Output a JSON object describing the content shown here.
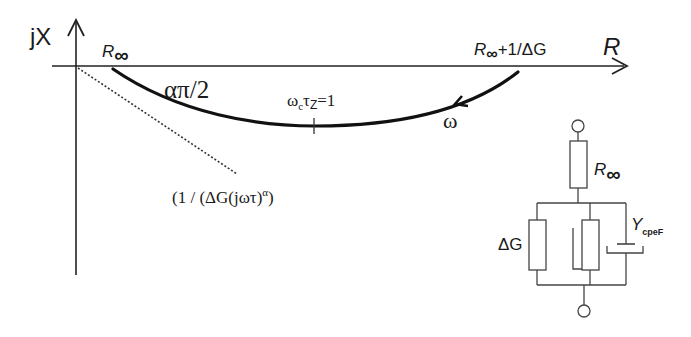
{
  "diagram": {
    "type": "Cole-Cole impedance plot with equivalent circuit",
    "axes": {
      "y_label": "jX",
      "x_label": "R"
    },
    "arc": {
      "start_label_main": "R",
      "start_label_sub": "∞",
      "end_label_main": "R",
      "end_label_sub": "∞",
      "end_label_suffix": "+1/ΔG",
      "angle_label": "απ/2",
      "peak_label_omega": "ω",
      "peak_label_omega_sub": "c",
      "peak_label_tau": "τ",
      "peak_label_tau_sub": "Z",
      "peak_label_value": "=1",
      "direction_label": "ω"
    },
    "asymptote_label": "(1 / (ΔG(jωτ)",
    "asymptote_label_sup": "α",
    "asymptote_label_close": ")",
    "circuit": {
      "series_resistor_label_main": "R",
      "series_resistor_label_sub": "∞",
      "parallel_resistor_label": "ΔG",
      "cpe_label_main": "Y",
      "cpe_label_sub": "cpeF"
    }
  }
}
